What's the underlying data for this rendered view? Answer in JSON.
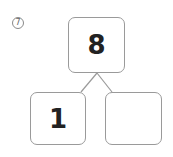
{
  "problem": {
    "number_label": "7",
    "whole": "8",
    "part_left": "1",
    "part_right": ""
  }
}
